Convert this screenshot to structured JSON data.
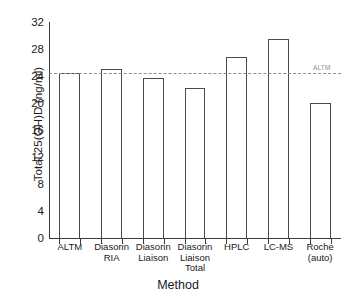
{
  "chart_data": {
    "type": "bar",
    "title": "",
    "xlabel": "Method",
    "ylabel": "Total 25(OH)D (ng/ml)",
    "categories": [
      "ALTM",
      "Diasorin\nRIA",
      "Diasorin\nLiaison",
      "Diasorin\nLiaison\nTotal",
      "HPLC",
      "LC-MS",
      "Roche\n(auto)"
    ],
    "values": [
      24.4,
      25.0,
      23.7,
      22.2,
      26.8,
      29.5,
      20.0
    ],
    "ylim": [
      0,
      32
    ],
    "yticks": [
      0,
      4,
      8,
      12,
      16,
      20,
      24,
      28,
      32
    ],
    "ytick_labels": [
      "0",
      "4",
      "8",
      "12",
      "16",
      "20",
      "24",
      "28",
      "32"
    ],
    "grid": false,
    "legend": "none",
    "bar_facecolor": "#ffffff",
    "bar_edgecolor": "#4a4a4a",
    "axis_color": "#3a3a3a",
    "annotations": [
      {
        "name": "altm-reference-line",
        "label": "ALTM",
        "value": 24.4,
        "style": "dashed",
        "color": "#8d8d8d"
      }
    ]
  }
}
